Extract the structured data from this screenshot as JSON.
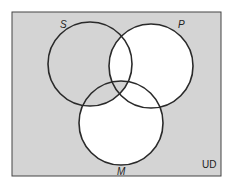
{
  "diagram": {
    "type": "venn",
    "universe_label": "UD",
    "sets": [
      {
        "id": "S",
        "label": "S",
        "cx": 90,
        "cy": 64,
        "r": 42
      },
      {
        "id": "P",
        "label": "P",
        "cx": 151,
        "cy": 66,
        "r": 42
      },
      {
        "id": "M",
        "label": "M",
        "cx": 121,
        "cy": 123,
        "r": 42
      }
    ],
    "shaded_regions": [
      "outside",
      "S only",
      "S∩M only",
      "S∩P∩M"
    ],
    "unshaded_regions": [
      "P only",
      "M only",
      "S∩P only",
      "P∩M only"
    ],
    "colors": {
      "shade": "#d4d4d4",
      "line": "#2a2a2a",
      "blank": "#ffffff"
    }
  }
}
